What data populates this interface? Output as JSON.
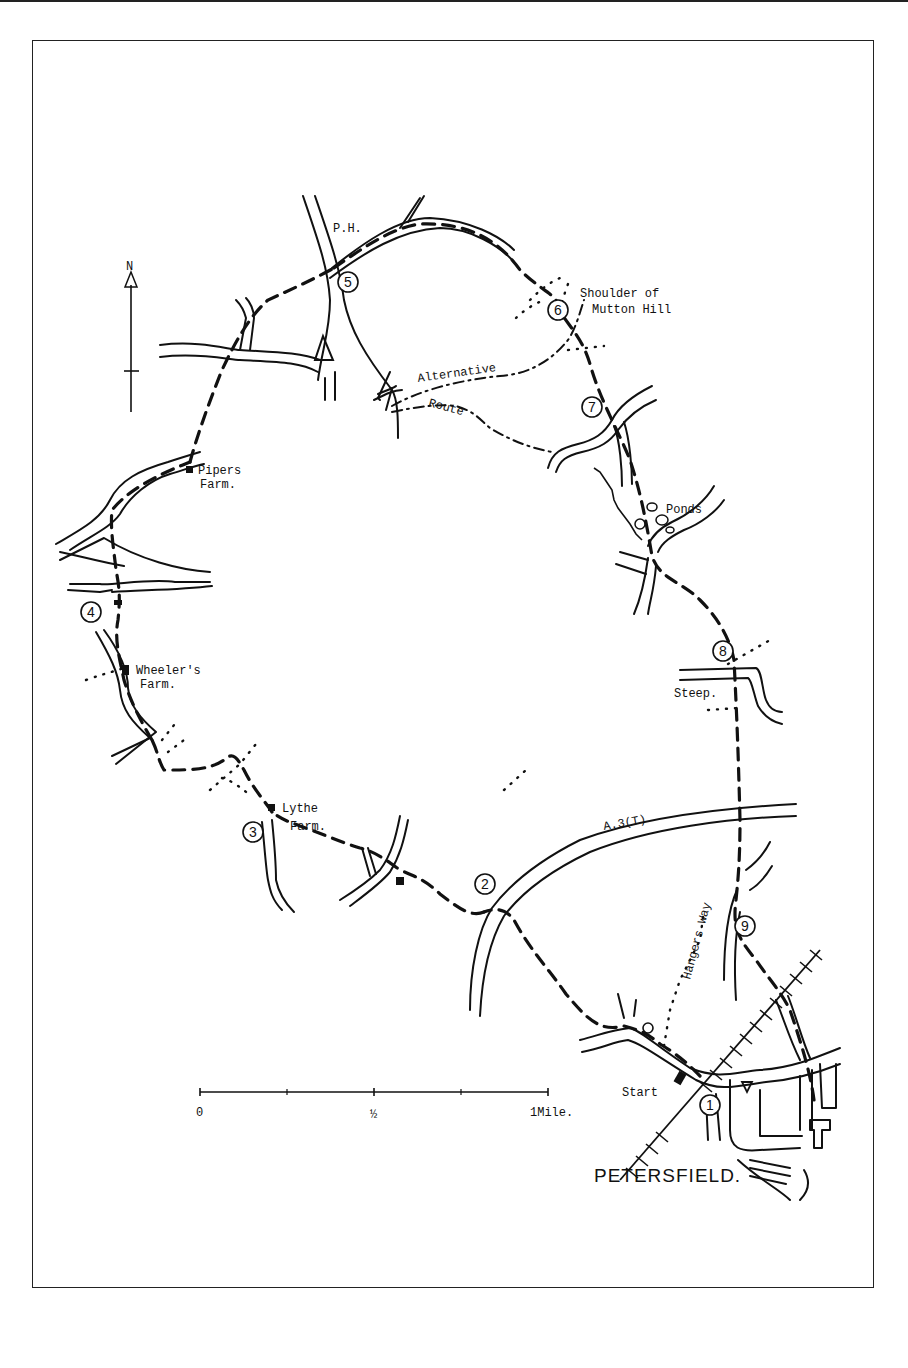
{
  "map": {
    "title": "Petersfield circular walk",
    "town_label": "PETERSFIELD.",
    "start_label": "Start",
    "north_label": "N",
    "pub_label": "P.H.",
    "trunk_road_label": "A.3(T)",
    "trail_label": "Hangers Way",
    "alternative_label_1": "Alternative",
    "alternative_label_2": "Route",
    "places": {
      "shoulder_1": "Shoulder of",
      "shoulder_2": "Mutton Hill",
      "ponds": "Ponds",
      "steep": "Steep.",
      "pipers_1": "Pipers",
      "pipers_2": "Farm.",
      "wheelers_1": "Wheeler's",
      "wheelers_2": "Farm.",
      "lythe_1": "Lythe",
      "lythe_2": "Farm."
    },
    "waypoints": [
      {
        "n": "1",
        "label": "Start"
      },
      {
        "n": "2",
        "label": "A3 crossing"
      },
      {
        "n": "3",
        "label": "Lythe Farm"
      },
      {
        "n": "4",
        "label": "Wheeler's Farm road"
      },
      {
        "n": "5",
        "label": "P.H."
      },
      {
        "n": "6",
        "label": "Shoulder of Mutton Hill"
      },
      {
        "n": "7",
        "label": "Road junction"
      },
      {
        "n": "8",
        "label": "Steep"
      },
      {
        "n": "9",
        "label": "Hangers Way"
      }
    ],
    "scale": {
      "ticks": [
        "0",
        "½",
        "1Mile."
      ],
      "unit": "Mile"
    }
  }
}
